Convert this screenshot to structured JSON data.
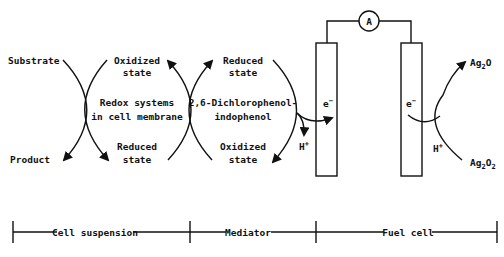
{
  "diagram": {
    "cell_side": {
      "substrate": "Substrate",
      "product": "Product",
      "oxidized_line1": "Oxidized",
      "oxidized_line2": "state",
      "reduced_line1": "Reduced",
      "reduced_line2": "state",
      "redox_line1": "Redox systems",
      "redox_line2": "in cell membrane"
    },
    "mediator_side": {
      "reduced_line1": "Reduced",
      "reduced_line2": "state",
      "oxidized_line1": "Oxidized",
      "oxidized_line2": "state",
      "name_line1": "2,6-Dichlorophenol-",
      "name_line2": "indophenol",
      "proton": "H",
      "proton_sup": "+",
      "electron": "e",
      "electron_sup": "−"
    },
    "fuel_cell": {
      "ammeter": "A",
      "electron": "e",
      "electron_sup": "−",
      "proton": "H",
      "proton_sup": "+",
      "ag2o_base": "Ag",
      "ag2o_sub": "2",
      "ag2o_rest": "O",
      "ag2o2_base": "Ag",
      "ag2o2_sub1": "2",
      "ag2o2_mid": "O",
      "ag2o2_sub2": "2"
    },
    "scale_bar": {
      "segments": [
        "Cell suspension",
        "Mediator",
        "Fuel cell"
      ]
    }
  }
}
